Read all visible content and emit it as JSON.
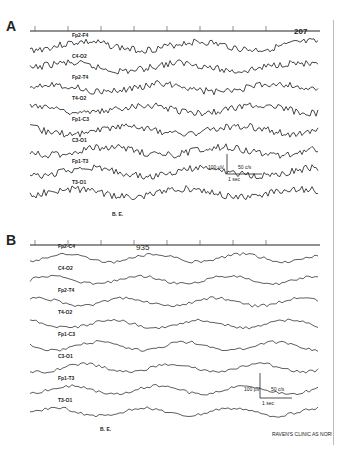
{
  "figure": {
    "panels": [
      {
        "letter": "A",
        "marker_label": "207",
        "channels": [
          "Fp2-F4",
          "F4-C4",
          "Fp2-F8",
          "F8-T4",
          "Fp1-F3",
          "C3-O1",
          "Fp1-T3",
          "T3-O1"
        ],
        "visible_channel_labels": [
          "Fp2-F4",
          "C4-O2",
          "Fp2-T4",
          "T4-O2",
          "Fp1-C3",
          "C3-O1",
          "Fp1-T3",
          "T3-O1"
        ],
        "footer_label": "B. E.",
        "calibration": {
          "amplitude": "100 µV",
          "filter": "50 c/s",
          "time": "1 sec"
        }
      },
      {
        "letter": "B",
        "marker_label": "935",
        "visible_channel_labels": [
          "Fp2-C4",
          "C4-O2",
          "Fp2-T4",
          "T4-O2",
          "Fp1-C3",
          "C3-O1",
          "Fp1-T3",
          "T3-O1"
        ],
        "footer_label": "B. E.",
        "calibration": {
          "amplitude": "100 µV",
          "filter": "50 c/s",
          "time": "1 sec"
        },
        "credit": "RAVEN'S CLINIC AS NORM"
      }
    ]
  }
}
